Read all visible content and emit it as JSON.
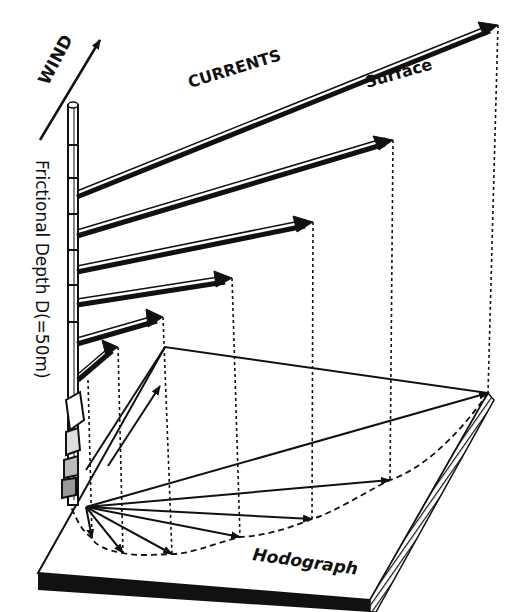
{
  "diagram": {
    "labels": {
      "wind": "WIND",
      "currents": "CURRENTS",
      "surface": "Surface",
      "depth_axis": "Frictional Depth D(=50m)",
      "hodograph": "Hodograph"
    },
    "colors": {
      "ink": "#111111",
      "paper": "#ffffff"
    },
    "current_arrows": [
      {
        "level": 1,
        "start": [
          77,
          193
        ],
        "end": [
          498,
          25
        ]
      },
      {
        "level": 2,
        "start": [
          77,
          232
        ],
        "end": [
          393,
          140
        ]
      },
      {
        "level": 3,
        "start": [
          77,
          268
        ],
        "end": [
          313,
          222
        ]
      },
      {
        "level": 4,
        "start": [
          77,
          302
        ],
        "end": [
          232,
          278
        ]
      },
      {
        "level": 5,
        "start": [
          77,
          340
        ],
        "end": [
          163,
          317
        ]
      },
      {
        "level": 6,
        "start": [
          77,
          378
        ],
        "end": [
          118,
          347
        ]
      }
    ],
    "hodograph_vectors": [
      {
        "end": [
          488,
          393
        ]
      },
      {
        "end": [
          390,
          480
        ]
      },
      {
        "end": [
          312,
          519
        ]
      },
      {
        "end": [
          240,
          537
        ]
      },
      {
        "end": [
          172,
          554
        ]
      },
      {
        "end": [
          123,
          553
        ]
      },
      {
        "end": [
          92,
          538
        ]
      }
    ]
  }
}
